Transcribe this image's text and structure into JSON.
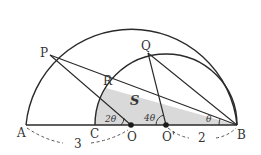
{
  "diagram": {
    "points": {
      "A": "A",
      "B": "B",
      "C": "C",
      "O": "O",
      "O_prime": "O'",
      "P": "P",
      "Q": "Q",
      "R": "R"
    },
    "region_label": "S",
    "angles": {
      "at_O": "2θ",
      "at_O_prime": "4θ",
      "at_B": "θ"
    },
    "lengths": {
      "AO": "3",
      "O_prime_B": "2"
    },
    "colors": {
      "stroke": "#2a2a2a",
      "shade": "#d9d9d9",
      "text": "#333333"
    }
  }
}
